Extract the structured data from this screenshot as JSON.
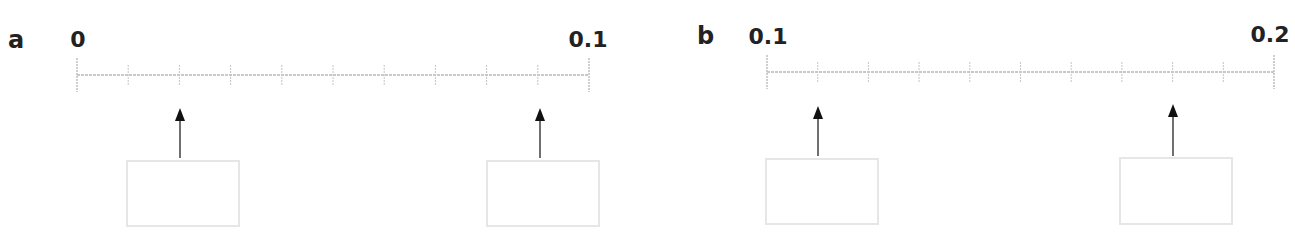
{
  "panels": [
    {
      "label": "a",
      "start_label": "0",
      "end_label": "0.1",
      "start_value": 0,
      "end_value": 0.1,
      "intervals": 10,
      "arrow_ticks": [
        2,
        9
      ],
      "answer_boxes": [
        "",
        ""
      ]
    },
    {
      "label": "b",
      "start_label": "0.1",
      "end_label": "0.2",
      "start_value": 0.1,
      "end_value": 0.2,
      "intervals": 10,
      "arrow_ticks": [
        1,
        8
      ],
      "answer_boxes": [
        "",
        ""
      ]
    }
  ],
  "colors": {
    "line": "#b8b8b8",
    "tick": "#c4c4c4",
    "arrow": "#111111",
    "box_border": "#e6e6e6",
    "text": "#222222"
  }
}
